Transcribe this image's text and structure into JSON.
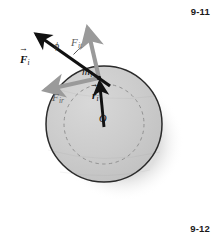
{
  "figure": {
    "number_top": "9-11",
    "number_bottom": "9-12",
    "caption": "Rigid body rotating about axis through O: force on mass element resolved into tangential and radial components"
  },
  "colors": {
    "disk_fill": "#c9c9c9",
    "disk_fill_light": "#d5d5d5",
    "disk_outline": "#2a2a2a",
    "dashed_circle": "#8f8f8f",
    "shadow": "#d9d9d9",
    "vector_black": "#111111",
    "vector_gray": "#9a9a9a",
    "label_text": "#111111",
    "page_background": "#ffffff"
  },
  "diagram": {
    "disk": {
      "center_x": 104,
      "center_y": 124,
      "radius": 58,
      "inner_dashed_radius": 40
    },
    "point_mass": {
      "x": 99,
      "y": 78,
      "label_base": "m",
      "label_sub": "i"
    },
    "origin": {
      "x": 104,
      "y": 124,
      "label": "O"
    },
    "vectors": [
      {
        "name": "force-total",
        "label_base": "F",
        "label_sub": "i",
        "vector_accent": "→",
        "bold": true,
        "color": "#111111",
        "from_x": 99,
        "from_y": 78,
        "to_x": 33,
        "to_y": 31,
        "label_x": 20,
        "label_y": 53
      },
      {
        "name": "force-tangential",
        "label_base": "F",
        "label_sub": "it",
        "vector_accent": "",
        "bold": false,
        "color": "#9a9a9a",
        "from_x": 99,
        "from_y": 78,
        "to_x": 87,
        "to_y": 25,
        "label_x": 71,
        "label_y": 36
      },
      {
        "name": "force-radial",
        "label_base": "F",
        "label_sub": "ir",
        "vector_accent": "",
        "bold": false,
        "color": "#9a9a9a",
        "from_x": 99,
        "from_y": 78,
        "to_x": 42,
        "to_y": 91,
        "label_x": 53,
        "label_y": 90
      },
      {
        "name": "position-radius",
        "label_base": "r",
        "label_sub": "i",
        "vector_accent": "→",
        "bold": true,
        "color": "#111111",
        "from_x": 104,
        "from_y": 124,
        "to_x": 99,
        "to_y": 78,
        "label_x": 91,
        "label_y": 88
      }
    ],
    "angle": {
      "name": "phi",
      "symbol": "ϕ",
      "label_x": 54,
      "label_y": 43
    }
  }
}
